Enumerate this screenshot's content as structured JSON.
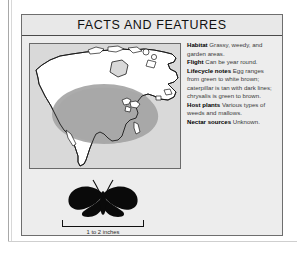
{
  "panel": {
    "title": "FACTS AND FEATURES"
  },
  "map": {
    "name": "north-america-range-map",
    "region_label": "North America",
    "land_color": "#ffffff",
    "range_color": "#a8a8a8",
    "background_color": "#d9d9d9",
    "outline_color": "#1a1a1a"
  },
  "facts": [
    {
      "term": "Habitat",
      "value": "Grassy, weedy, and garden areas."
    },
    {
      "term": "Flight",
      "value": "Can be year round."
    },
    {
      "term": "Lifecycle notes",
      "value": "Egg ranges from green to white brown; caterpillar is tan with dark lines; chrysalis is green to brown."
    },
    {
      "term": "Host plants",
      "value": "Various types of weeds and mallows."
    },
    {
      "term": "Nectar sources",
      "value": "Unknown."
    }
  ],
  "specimen": {
    "silhouette_name": "butterfly-silhouette",
    "silhouette_color": "#0a0a0a",
    "scale_label": "1 to 2 inches"
  }
}
